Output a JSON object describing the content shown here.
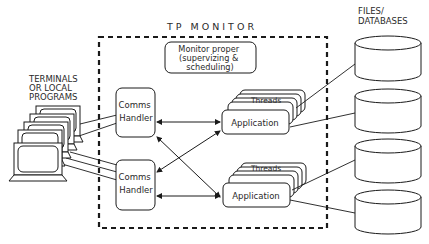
{
  "diagram": {
    "title": "TP MONITOR",
    "terminals_label_lines": [
      "TERMINALS",
      "OR LOCAL",
      "PROGRAMS"
    ],
    "files_label_lines": [
      "FILES/",
      "DATABASES"
    ],
    "monitor_proper_lines": [
      "Monitor proper",
      "(supervizing &",
      "scheduling)"
    ],
    "comms_handlers": [
      {
        "lines": [
          "Comms",
          "Handler"
        ]
      },
      {
        "lines": [
          "Comms",
          "Handler"
        ]
      }
    ],
    "applications": [
      {
        "threads_label": "Threads",
        "label": "Application"
      },
      {
        "threads_label": "Threads",
        "label": "Application"
      }
    ],
    "databases_count": 4,
    "terminals_count": 5,
    "colors": {
      "stroke": "#1a1a1a",
      "text": "#2a2a2a",
      "background": "#ffffff"
    }
  }
}
